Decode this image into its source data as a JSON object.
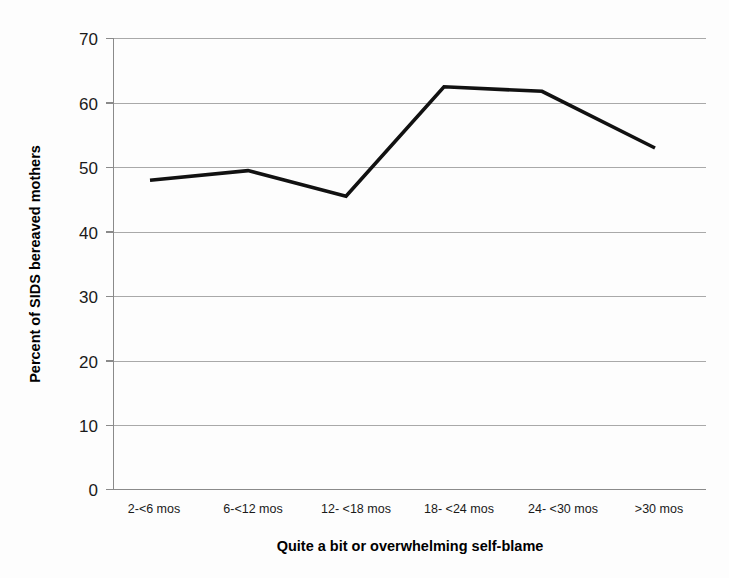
{
  "chart_data": {
    "type": "line",
    "title": "",
    "xlabel": "Quite a bit or overwhelming self-blame",
    "ylabel": "Percent of SIDS bereaved mothers",
    "categories": [
      "2-<6 mos",
      "6-<12 mos",
      "12- <18 mos",
      "18- <24 mos",
      "24- <30 mos",
      ">30 mos"
    ],
    "values": [
      48.0,
      49.5,
      45.5,
      62.5,
      61.8,
      53.0
    ],
    "series": [
      {
        "name": "Percent of SIDS bereaved mothers",
        "values": [
          48.0,
          49.5,
          45.5,
          62.5,
          61.8,
          53.0
        ]
      }
    ],
    "ylim": [
      0,
      70
    ],
    "ytick_labels": [
      "0",
      "10",
      "20",
      "30",
      "40",
      "50",
      "60",
      "70"
    ],
    "ytick_values": [
      0,
      10,
      20,
      30,
      40,
      50,
      60,
      70
    ],
    "grid": "horizontal",
    "legend": "none",
    "line_color": "#111111",
    "gridline_color": "#a9a9a9",
    "background_color": "#ffffff"
  },
  "axes": {
    "y_title": "Percent of SIDS bereaved mothers",
    "x_title": "Quite a bit or overwhelming self-blame"
  },
  "ytick0": "0",
  "ytick1": "10",
  "ytick2": "20",
  "ytick3": "30",
  "ytick4": "40",
  "ytick5": "50",
  "ytick6": "60",
  "ytick7": "70",
  "xtick0": "2-<6 mos",
  "xtick1": "6-<12 mos",
  "xtick2": "12- <18 mos",
  "xtick3": "18- <24 mos",
  "xtick4": "24- <30 mos",
  "xtick5": ">30 mos"
}
